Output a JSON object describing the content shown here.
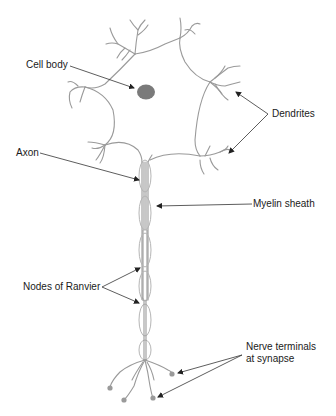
{
  "figure": {
    "labels": {
      "cell_body": "Cell body",
      "dendrites": "Dendrites",
      "axon": "Axon",
      "myelin_sheath": "Myelin sheath",
      "nodes_of_ranvier": "Nodes of Ranvier",
      "nerve_terminals_line1": "Nerve terminals",
      "nerve_terminals_line2": "at synapse"
    },
    "colors": {
      "neuron_outline": "#9a9a9a",
      "nucleus": "#7a7a7a",
      "leader_lines": "#333333",
      "text": "#1a1a1a",
      "background": "#ffffff"
    }
  }
}
